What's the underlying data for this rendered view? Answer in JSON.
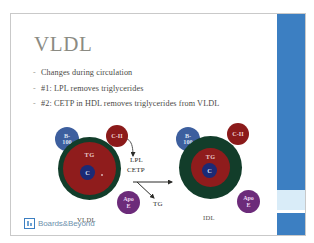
{
  "slide": {
    "title": "VLDL",
    "bullet_marker": "-",
    "bullets": [
      "Changes during circulation",
      "#1: LPL removes triglycerides",
      "#2: CETP in HDL removes triglycerides from VLDL"
    ],
    "accent_color": "#3c7fc2",
    "accent_light_color": "#d9ecf8",
    "title_color": "#8b8b83",
    "text_color": "#4a4a46"
  },
  "figure": {
    "left_particle": {
      "caption": "VLDL",
      "core_label": "C",
      "tg_label": "TG",
      "shell_color": "#123d2a",
      "tg_color": "#8f1c1c",
      "core_color": "#1b2a75",
      "apolipoproteins": [
        {
          "name": "apo-b100",
          "line1": "B-",
          "line2": "100",
          "color": "#3d5f9e"
        },
        {
          "name": "apo-cii",
          "line1": "C-II",
          "line2": "",
          "color": "#8b1a1a"
        },
        {
          "name": "apo-e",
          "line1": "Apo",
          "line2": "E",
          "color": "#6c2b7a"
        }
      ]
    },
    "right_particle": {
      "caption": "IDL",
      "core_label": "C",
      "tg_label": "TG",
      "shell_color": "#123d2a",
      "tg_color": "#8f1c1c",
      "core_color": "#1b2a75",
      "apolipoproteins": [
        {
          "name": "apo-b100",
          "line1": "B-",
          "line2": "100",
          "color": "#3d5f9e"
        },
        {
          "name": "apo-cii",
          "line1": "C-II",
          "line2": "",
          "color": "#8b1a1a"
        },
        {
          "name": "apo-e",
          "line1": "Apo",
          "line2": "E",
          "color": "#6c2b7a"
        }
      ]
    },
    "middle_labels": {
      "enzyme_1": "LPL",
      "enzyme_2": "CETP",
      "product": "TG"
    }
  },
  "footer": {
    "logo_text": "Boards&Beyond",
    "logo_sub": "A STEP 1 REVIEW"
  }
}
